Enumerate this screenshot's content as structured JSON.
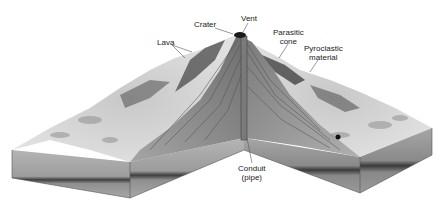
{
  "diagram": {
    "labels": {
      "crater": "Crater",
      "vent": "Vent",
      "lava": "Lava",
      "parasitic_cone_line1": "Parasitic",
      "parasitic_cone_line2": "cone",
      "pyroclastic_line1": "Pyroclastic",
      "pyroclastic_line2": "material",
      "conduit_line1": "Conduit",
      "conduit_line2": "(pipe)"
    },
    "colors": {
      "background": "#ffffff",
      "surface_light": "#d9d9d9",
      "surface_mid": "#a8a8a8",
      "layer_fill": "#9a9a9a",
      "layer_dark": "#4a4a4a",
      "conduit": "#7a7a7a",
      "label_text": "#222222",
      "leader_line": "#555555"
    }
  }
}
